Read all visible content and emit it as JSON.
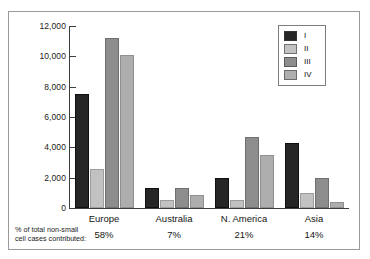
{
  "chart_data": {
    "type": "bar",
    "title": "",
    "xlabel": "",
    "ylabel": "",
    "ylim": [
      0,
      12000
    ],
    "grid": false,
    "legend_position": "top-right",
    "categories": [
      "Europe",
      "Australia",
      "N. America",
      "Asia"
    ],
    "category_percentages": [
      "58%",
      "7%",
      "21%",
      "14%"
    ],
    "y_ticks": [
      "0",
      "2,000",
      "4,000",
      "6,000",
      "8,000",
      "10,000",
      "12,000"
    ],
    "y_tick_values": [
      0,
      2000,
      4000,
      6000,
      8000,
      10000,
      12000
    ],
    "series": [
      {
        "name": "I",
        "color": "#262626",
        "values": [
          7500,
          1300,
          2000,
          4300
        ]
      },
      {
        "name": "II",
        "color": "#c2c2c2",
        "values": [
          2600,
          500,
          500,
          1000
        ]
      },
      {
        "name": "III",
        "color": "#8d8d8d",
        "values": [
          11200,
          1300,
          4700,
          2000
        ]
      },
      {
        "name": "IV",
        "color": "#aeaeae",
        "values": [
          10100,
          850,
          3500,
          400
        ]
      }
    ],
    "annotation": {
      "line1": "% of total non-small",
      "line2": "cell cases contributed:"
    }
  },
  "legend": {
    "items": [
      {
        "label": "I"
      },
      {
        "label": "II"
      },
      {
        "label": "III"
      },
      {
        "label": "IV"
      }
    ]
  }
}
